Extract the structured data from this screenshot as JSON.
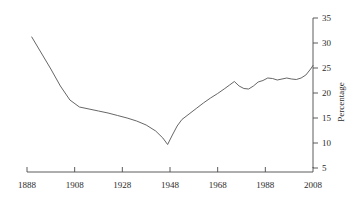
{
  "chart_data": {
    "type": "line",
    "title": "",
    "xlabel": "",
    "ylabel": "Percentage",
    "xlim": [
      1888,
      2008
    ],
    "ylim": [
      5,
      35
    ],
    "grid": false,
    "legend": null,
    "xticks": [
      1888,
      1908,
      1928,
      1948,
      1968,
      1988,
      2008
    ],
    "xtick_labels": [
      "1888",
      "1908",
      "1928",
      "1948",
      "1968",
      "1988",
      "2008"
    ],
    "yticks": [
      5,
      10,
      15,
      20,
      25,
      30,
      35
    ],
    "ytick_labels": [
      "5",
      "10",
      "15",
      "20",
      "25",
      "30",
      "35"
    ],
    "y_axis_position": "right",
    "line_color": "#555555",
    "series": [
      {
        "name": "Percentage",
        "x": [
          1890,
          1894,
          1898,
          1902,
          1906,
          1910,
          1914,
          1918,
          1922,
          1926,
          1930,
          1934,
          1938,
          1942,
          1945,
          1947,
          1949,
          1951,
          1953,
          1956,
          1959,
          1962,
          1965,
          1968,
          1971,
          1973,
          1975,
          1977,
          1979,
          1981,
          1983,
          1985,
          1987,
          1989,
          1991,
          1993,
          1995,
          1997,
          1999,
          2001,
          2003,
          2005,
          2007,
          2008
        ],
        "y": [
          31.2,
          28.0,
          24.8,
          21.4,
          18.6,
          17.2,
          16.8,
          16.4,
          16.0,
          15.5,
          15.0,
          14.4,
          13.6,
          12.4,
          11.0,
          9.7,
          11.6,
          13.4,
          14.7,
          15.8,
          16.9,
          18.0,
          19.0,
          19.9,
          20.9,
          21.6,
          22.3,
          21.4,
          20.9,
          20.8,
          21.4,
          22.2,
          22.5,
          23.0,
          22.9,
          22.6,
          22.8,
          23.0,
          22.8,
          22.7,
          23.0,
          23.6,
          24.8,
          25.5
        ]
      }
    ]
  }
}
